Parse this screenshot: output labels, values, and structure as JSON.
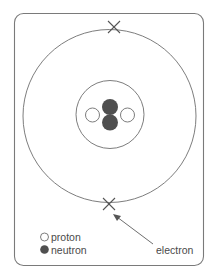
{
  "diagram": {
    "type": "atom-model",
    "colors": {
      "line": "#6e6e6e",
      "neutron_fill": "#4f4f4f",
      "proton_fill": "#ffffff",
      "background": "#ffffff",
      "text": "#4a4a4a"
    },
    "nucleus": {
      "protons": 2,
      "neutrons": 2
    },
    "electrons": 2,
    "legend": {
      "items": [
        {
          "symbol": "open-circle",
          "label": "proton"
        },
        {
          "symbol": "filled-circle",
          "label": "neutron"
        }
      ]
    },
    "annotations": {
      "electron_label": "electron"
    }
  }
}
